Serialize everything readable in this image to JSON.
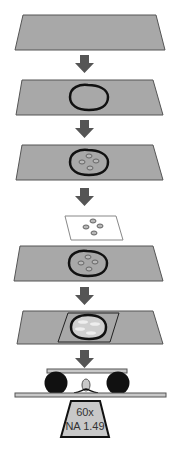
{
  "diagram": {
    "title": "",
    "steps": [
      {
        "id": "slide-empty",
        "description": "Empty glass slide"
      },
      {
        "id": "slide-cell-outline",
        "description": "Slide with circled cell region"
      },
      {
        "id": "slide-cell-particles",
        "description": "Slide with cell containing particles"
      },
      {
        "id": "coverslip",
        "description": "Coverslip with particles"
      },
      {
        "id": "slide-cell-particles-2",
        "description": "Slide with cell containing particles"
      },
      {
        "id": "slide-with-coverslip",
        "description": "Slide with coverslip mounted over cell"
      },
      {
        "id": "imaging-setup",
        "description": "Mounted sample on spacers above objective"
      }
    ],
    "objective": {
      "magnification": "60x",
      "na": "NA 1.49"
    },
    "colors": {
      "slide_fill": "#a8a8a8",
      "slide_stroke": "#555555",
      "arrow": "#555555",
      "cell_outline": "#111111",
      "coverslip_fill": "#ffffff",
      "spacer": "#111111",
      "objective_fill": "#c8c8c8"
    }
  }
}
